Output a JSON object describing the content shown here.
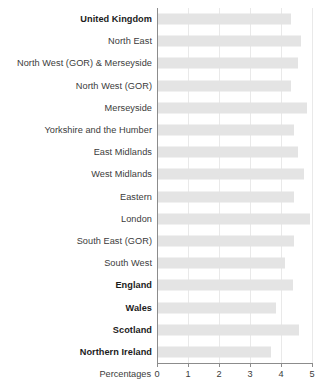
{
  "chart_data": {
    "type": "bar",
    "orientation": "horizontal",
    "title": "",
    "xlabel": "Percentages",
    "ylabel": "",
    "xlim": [
      0,
      5
    ],
    "xticks": [
      0,
      1,
      2,
      3,
      4,
      5
    ],
    "xtick_labels": [
      "0",
      "1",
      "2",
      "3",
      "4",
      "5"
    ],
    "grid": true,
    "legend": "none",
    "bar_color": "#e4e4e4",
    "categories": [
      "United Kingdom",
      "North East",
      "North West (GOR) & Merseyside",
      "North West (GOR)",
      "Merseyside",
      "Yorkshire and the Humber",
      "East Midlands",
      "West Midlands",
      "Eastern",
      "London",
      "South East (GOR)",
      "South West",
      "England",
      "Wales",
      "Scotland",
      "Northern Ireland"
    ],
    "values": [
      4.3,
      4.6,
      4.5,
      4.3,
      4.8,
      4.4,
      4.5,
      4.7,
      4.4,
      4.9,
      4.4,
      4.1,
      4.35,
      3.8,
      4.55,
      3.65
    ],
    "emphasis": [
      true,
      false,
      false,
      false,
      false,
      false,
      false,
      false,
      false,
      false,
      false,
      false,
      true,
      true,
      true,
      true
    ]
  }
}
